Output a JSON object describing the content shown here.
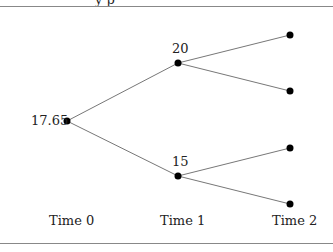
{
  "diagram": {
    "type": "binomial-tree",
    "header_text_cut": "y        p",
    "nodes": {
      "root": {
        "label": "17.65"
      },
      "up": {
        "label": "20"
      },
      "down": {
        "label": "15"
      }
    },
    "time_labels": [
      "Time 0",
      "Time 1",
      "Time 2"
    ]
  }
}
